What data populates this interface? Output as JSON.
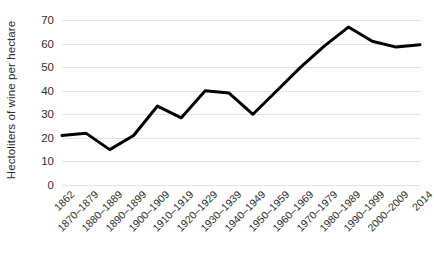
{
  "chart_data": {
    "type": "line",
    "title": "",
    "xlabel": "",
    "ylabel": "Hectoliters of wine per hectare",
    "ylim": [
      0,
      70
    ],
    "yticks": [
      0,
      10,
      20,
      30,
      40,
      50,
      60,
      70
    ],
    "ytick_labels": [
      "0",
      "10",
      "20",
      "30",
      "40",
      "50",
      "60",
      "70"
    ],
    "grid": true,
    "legend": false,
    "legend_position": "none",
    "line_color": "#000000",
    "line_width": 3,
    "markers": false,
    "gridline_color": "#e2e2e2",
    "background_color": "#ffffff",
    "categories": [
      "1862",
      "1870–1879",
      "1880–1889",
      "1890–1899",
      "1900–1909",
      "1910–1919",
      "1920–1929",
      "1930–1939",
      "1940–1949",
      "1950–1959",
      "1960–1969",
      "1970–1979",
      "1980–1989",
      "1990–1999",
      "2000–2009",
      "2014"
    ],
    "values": [
      21,
      22,
      15,
      21,
      33.5,
      28.5,
      40,
      39,
      30,
      40,
      50,
      59,
      67,
      61,
      58.5,
      59.5
    ]
  }
}
